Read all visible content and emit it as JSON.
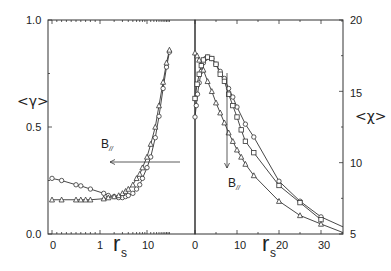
{
  "chart_data": [
    {
      "type": "line",
      "panel": "left",
      "ylabel": "<γ>",
      "xlabel": "r_s",
      "ylim": [
        0.0,
        1.0
      ],
      "yticks": [
        "0.0",
        "0.5",
        "1.0"
      ],
      "xscale": "log",
      "xticks": [
        "0",
        "1",
        "10"
      ],
      "annotation": {
        "text": "B",
        "subscript": "//",
        "arrow": "left"
      },
      "series": [
        {
          "name": "circles",
          "marker": "circle",
          "x": [
            0,
            0.2,
            0.5,
            0.6,
            0.8,
            1.2,
            1.5,
            2,
            2.5,
            3,
            3.5,
            4,
            5,
            6,
            7,
            8,
            10,
            12,
            15,
            18,
            22,
            26,
            30
          ],
          "y": [
            0.26,
            0.25,
            0.23,
            0.225,
            0.21,
            0.19,
            0.18,
            0.175,
            0.17,
            0.17,
            0.175,
            0.18,
            0.19,
            0.21,
            0.23,
            0.26,
            0.31,
            0.36,
            0.45,
            0.55,
            0.68,
            0.78,
            0.85
          ]
        },
        {
          "name": "triangles",
          "marker": "triangle",
          "x": [
            0,
            0.2,
            0.5,
            0.6,
            0.7,
            0.8,
            1.2,
            1.5,
            2,
            2.5,
            3,
            3.5,
            4,
            5,
            6,
            7,
            8,
            10,
            12,
            15,
            18,
            22,
            26,
            30
          ],
          "y": [
            0.16,
            0.16,
            0.16,
            0.16,
            0.16,
            0.16,
            0.165,
            0.17,
            0.175,
            0.18,
            0.19,
            0.2,
            0.21,
            0.23,
            0.26,
            0.28,
            0.31,
            0.36,
            0.42,
            0.5,
            0.6,
            0.71,
            0.8,
            0.86
          ]
        }
      ]
    },
    {
      "type": "line",
      "panel": "right",
      "ylabel": "<χ>",
      "xlabel": "r_s",
      "ylim": [
        5,
        20
      ],
      "yticks": [
        "5",
        "10",
        "15",
        "20"
      ],
      "xlim": [
        0,
        35
      ],
      "xticks": [
        "0",
        "10",
        "20",
        "30"
      ],
      "annotation": {
        "text": "B",
        "subscript": "//",
        "arrow": "down"
      },
      "series": [
        {
          "name": "circles",
          "marker": "circle",
          "x": [
            0,
            0.3,
            0.6,
            1,
            1.5,
            2,
            2.5,
            3,
            4,
            5,
            6,
            7,
            8,
            9,
            10,
            12,
            14,
            20,
            25,
            30
          ],
          "y": [
            13.2,
            14,
            14.8,
            15.6,
            16.4,
            17,
            17.3,
            17.4,
            17.3,
            16.9,
            16.4,
            15.9,
            15.2,
            14.6,
            13.9,
            12.7,
            11.8,
            8.7,
            7.3,
            6.2
          ]
        },
        {
          "name": "squares",
          "marker": "square",
          "x": [
            0,
            0.5,
            1,
            1.5,
            2,
            3,
            4,
            5,
            6,
            7,
            8,
            9,
            10,
            11,
            12,
            14,
            20,
            25,
            30
          ],
          "y": [
            14.5,
            15.5,
            16.2,
            16.8,
            17.2,
            17.4,
            17.3,
            16.9,
            16.2,
            15.7,
            14.8,
            14,
            13.2,
            12.3,
            11.5,
            10.7,
            8.4,
            7.2,
            6.0
          ]
        },
        {
          "name": "triangles",
          "marker": "triangle",
          "x": [
            0,
            0.5,
            1,
            2,
            3,
            4,
            5,
            6,
            7,
            8,
            9,
            10,
            11,
            12,
            14,
            20,
            25,
            30
          ],
          "y": [
            17.7,
            17.5,
            17.2,
            16.5,
            15.7,
            15,
            14.2,
            13.5,
            12.8,
            12.1,
            11.5,
            10.9,
            10.4,
            9.9,
            9.1,
            7.3,
            6.3,
            5.7
          ]
        }
      ]
    }
  ],
  "labels": {
    "left_y": "<γ>",
    "right_y": "<χ>",
    "rs_main": "r",
    "rs_sub": "s",
    "b_main": "B",
    "b_sub": "//",
    "left_yticks": [
      "1.0",
      "0.5",
      "0.0"
    ],
    "left_xticks": [
      "0",
      "1",
      "10"
    ],
    "right_yticks": [
      "20",
      "15",
      "10",
      "5"
    ],
    "right_xticks": [
      "0",
      "10",
      "20",
      "30"
    ]
  }
}
